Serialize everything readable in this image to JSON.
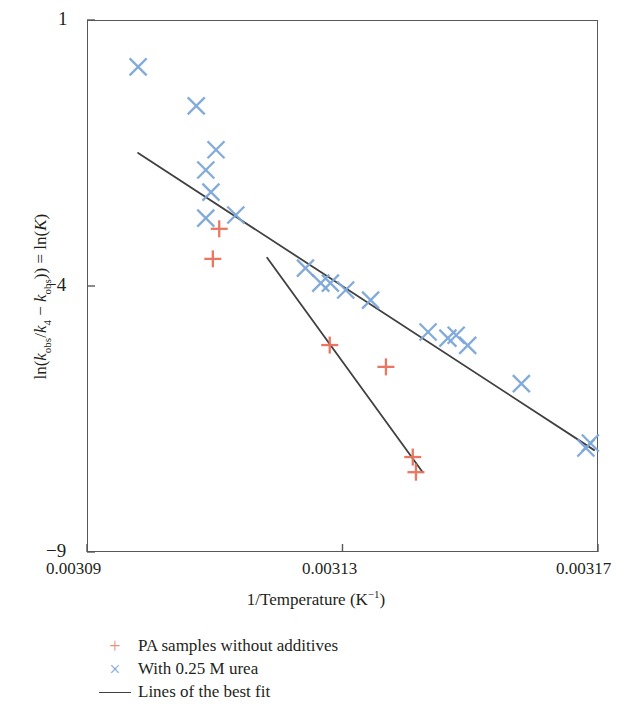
{
  "chart_data": {
    "type": "scatter",
    "title": "",
    "xlabel": "1/Temperature (K⁻¹)",
    "ylabel": "ln(k_obs/k_4 − k_obs)) = ln(K)",
    "xlim": [
      0.00309,
      0.00317
    ],
    "ylim": [
      -9,
      1
    ],
    "xticks": [
      "0.00309",
      "0.00313",
      "0.00317"
    ],
    "xtick_values": [
      0.00309,
      0.00313,
      0.00317
    ],
    "yticks": [
      "1",
      "−4",
      "−9"
    ],
    "ytick_values": [
      1,
      -4,
      -9
    ],
    "grid": false,
    "legend_position": "below",
    "series": [
      {
        "name": "PA samples without additives",
        "marker": "plus",
        "color": "#e8705a",
        "points": [
          [
            0.0031107,
            -2.925
          ],
          [
            0.0031097,
            -3.49
          ],
          [
            0.003128,
            -5.11
          ],
          [
            0.0031368,
            -5.52
          ],
          [
            0.003141,
            -7.215
          ],
          [
            0.0031415,
            -7.5
          ]
        ]
      },
      {
        "name": "With 0.25 M urea",
        "marker": "cross",
        "color": "#7da7d9",
        "points": [
          [
            0.003098,
            0.12
          ],
          [
            0.0031071,
            -0.615
          ],
          [
            0.0031102,
            -1.44
          ],
          [
            0.0031086,
            -1.82
          ],
          [
            0.0031094,
            -2.235
          ],
          [
            0.0031133,
            -2.665
          ],
          [
            0.0031086,
            -2.725
          ],
          [
            0.0031242,
            -3.665
          ],
          [
            0.0031266,
            -3.945
          ],
          [
            0.0031281,
            -3.945
          ],
          [
            0.0031305,
            -4.075
          ],
          [
            0.0031344,
            -4.265
          ],
          [
            0.0031434,
            -4.865
          ],
          [
            0.0031465,
            -4.98
          ],
          [
            0.0031478,
            -4.925
          ],
          [
            0.0031496,
            -5.115
          ],
          [
            0.003158,
            -5.835
          ],
          [
            0.0031681,
            -7.045
          ],
          [
            0.0031688,
            -6.95
          ]
        ]
      }
    ],
    "fit_lines": [
      {
        "name": "Lines of the best fit (upper)",
        "color": "#404040",
        "x0": 0.003098,
        "y0": -1.5,
        "x1": 0.0031694,
        "y1": -7.085
      },
      {
        "name": "Lines of the best fit (lower)",
        "color": "#404040",
        "x0": 0.0031182,
        "y0": -3.47,
        "x1": 0.0031425,
        "y1": -7.49
      }
    ]
  },
  "axes": {
    "y_ticks": [
      {
        "label": "1"
      },
      {
        "label": "−4"
      },
      {
        "label": "−9"
      }
    ],
    "x_ticks": [
      {
        "label": "0.00309"
      },
      {
        "label": "0.00313"
      },
      {
        "label": "0.00317"
      }
    ],
    "x_title_main": "1/Temperature (K",
    "x_title_sup": "−1",
    "x_title_tail": ")",
    "y_title_p1": "ln(",
    "y_title_k1": "k",
    "y_title_sub1": "obs",
    "y_title_p2": "/",
    "y_title_k2": "k",
    "y_title_sub2": "4",
    "y_title_p3": " − ",
    "y_title_k3": "k",
    "y_title_sub3": "obs",
    "y_title_p4": ")) = ln(",
    "y_title_K": "K",
    "y_title_p5": ")"
  },
  "legend": {
    "items": [
      {
        "key": "+",
        "label": "PA samples without additives",
        "color": "#e8927c"
      },
      {
        "key": "×",
        "label": "With 0.25 M urea",
        "color": "#7da7d9"
      },
      {
        "key": "",
        "label": "Lines of the best fit",
        "color": "#404040"
      }
    ]
  }
}
